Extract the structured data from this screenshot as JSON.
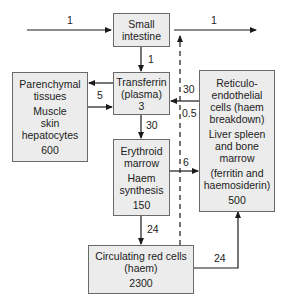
{
  "diagram": {
    "colors": {
      "box_fill": "#ececec",
      "box_border": "#6a6a6a",
      "line": "#1a1a1a",
      "text": "#222222"
    },
    "nodes": {
      "small_intestine": {
        "lines": [
          "Small",
          "intestine"
        ]
      },
      "transferrin": {
        "lines": [
          "Transferrin",
          "(plasma)"
        ],
        "value": "3"
      },
      "parenchymal": {
        "lines": [
          "Parenchymal",
          "tissues"
        ],
        "sublines": [
          "Muscle",
          "skin",
          "hepatocytes"
        ],
        "value": "600"
      },
      "erythroid": {
        "lines": [
          "Erythroid",
          "marrow"
        ],
        "sublines": [
          "Haem",
          "synthesis"
        ],
        "value": "150"
      },
      "reticulo": {
        "lines": [
          "Reticulo-",
          "endothelial",
          "cells (haem",
          "breakdown)"
        ],
        "sublines": [
          "Liver spleen",
          "and bone",
          "marrow"
        ],
        "sublines2": [
          "(ferritin and",
          "haemosiderin)"
        ],
        "value": "500"
      },
      "circulating": {
        "lines": [
          "Circulating red cells",
          "(haem)"
        ],
        "value": "2300"
      }
    },
    "edges": [
      {
        "id": "intake",
        "from": "external",
        "to": "small_intestine",
        "label": "1"
      },
      {
        "id": "loss",
        "from": "small_intestine",
        "to": "external",
        "label": "1"
      },
      {
        "id": "absorption",
        "from": "small_intestine",
        "to": "transferrin",
        "label": "1"
      },
      {
        "id": "parenchymal_exchange",
        "from": "transferrin",
        "to": "parenchymal",
        "label": "5",
        "bidirectional": true
      },
      {
        "id": "to_marrow",
        "from": "transferrin",
        "to": "erythroid",
        "label": "30"
      },
      {
        "id": "re_to_transferrin",
        "from": "reticulo",
        "to": "transferrin",
        "label": "30"
      },
      {
        "id": "dashed_loss",
        "from": "circulating",
        "to": "loss",
        "label": "0.5",
        "style": "dashed"
      },
      {
        "id": "ineffective",
        "from": "erythroid",
        "to": "reticulo",
        "label": "6"
      },
      {
        "id": "to_rbc",
        "from": "erythroid",
        "to": "circulating",
        "label": "24"
      },
      {
        "id": "senescence",
        "from": "circulating",
        "to": "reticulo",
        "label": "24"
      }
    ]
  }
}
